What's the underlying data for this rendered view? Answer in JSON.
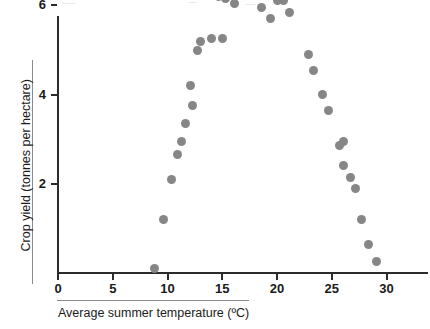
{
  "chart_data": {
    "type": "scatter",
    "title": "",
    "xlabel": "Average summer temperature (ºC)",
    "ylabel": "Crop yield (tonnes per hectare)",
    "xlim": [
      0,
      34
    ],
    "ylim": [
      0,
      6.9
    ],
    "xticks": [
      0,
      5,
      10,
      15,
      20,
      25,
      30
    ],
    "xtick_labels": [
      "0",
      "5",
      "10",
      "15",
      "20",
      "25",
      "30"
    ],
    "yticks": [
      2,
      4,
      6
    ],
    "ytick_labels": [
      "2",
      "4",
      "6"
    ],
    "grid": false,
    "legend": null,
    "point_color": "#868686",
    "axis_color": "#2b2b2b",
    "series": [
      {
        "name": "Crop yield vs average summer temperature",
        "points": [
          {
            "x": 8.8,
            "y": 0.1
          },
          {
            "x": 9.6,
            "y": 1.2
          },
          {
            "x": 10.4,
            "y": 2.1
          },
          {
            "x": 10.9,
            "y": 2.65
          },
          {
            "x": 11.3,
            "y": 2.95
          },
          {
            "x": 11.6,
            "y": 3.35
          },
          {
            "x": 12.1,
            "y": 4.2
          },
          {
            "x": 12.3,
            "y": 3.75
          },
          {
            "x": 12.7,
            "y": 5.0
          },
          {
            "x": 13.0,
            "y": 5.2
          },
          {
            "x": 14.0,
            "y": 5.25
          },
          {
            "x": 15.0,
            "y": 5.25
          },
          {
            "x": 14.7,
            "y": 6.2
          },
          {
            "x": 15.3,
            "y": 6.15
          },
          {
            "x": 16.1,
            "y": 6.05
          },
          {
            "x": 16.6,
            "y": 6.6
          },
          {
            "x": 17.4,
            "y": 6.7
          },
          {
            "x": 18.6,
            "y": 5.95
          },
          {
            "x": 19.4,
            "y": 6.25
          },
          {
            "x": 19.4,
            "y": 5.7
          },
          {
            "x": 20.0,
            "y": 6.1
          },
          {
            "x": 20.6,
            "y": 6.1
          },
          {
            "x": 21.1,
            "y": 5.85
          },
          {
            "x": 22.9,
            "y": 4.9
          },
          {
            "x": 23.3,
            "y": 4.55
          },
          {
            "x": 24.2,
            "y": 4.0
          },
          {
            "x": 24.7,
            "y": 3.65
          },
          {
            "x": 25.7,
            "y": 2.85
          },
          {
            "x": 26.1,
            "y": 2.95
          },
          {
            "x": 26.1,
            "y": 2.4
          },
          {
            "x": 26.7,
            "y": 2.15
          },
          {
            "x": 27.2,
            "y": 1.9
          },
          {
            "x": 27.7,
            "y": 1.2
          },
          {
            "x": 28.4,
            "y": 0.65
          },
          {
            "x": 29.1,
            "y": 0.25
          }
        ]
      }
    ]
  }
}
